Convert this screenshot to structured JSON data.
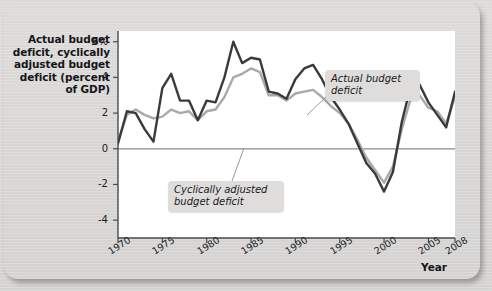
{
  "chart_data": {
    "type": "line",
    "title": "",
    "ylabel": "Actual budget deficit, cyclically adjusted budget deficit (percent of GDP)",
    "xlabel": "Year",
    "ylim": [
      -5,
      6.6
    ],
    "xlim": [
      1970,
      2008
    ],
    "yticks": [
      6,
      4,
      2,
      0,
      -2,
      -4
    ],
    "ytick_labels": [
      "6%",
      "4",
      "2",
      "0",
      "-2",
      "-4"
    ],
    "xticks": [
      1970,
      1975,
      1980,
      1985,
      1990,
      1995,
      2000,
      2005,
      2008
    ],
    "xtick_labels": [
      "1970",
      "1975",
      "1980",
      "1985",
      "1990",
      "1995",
      "2000",
      "2005",
      "2008"
    ],
    "grid": false,
    "legend_position": "annotations",
    "zero_line": 0,
    "x": [
      1970,
      1971,
      1972,
      1973,
      1974,
      1975,
      1976,
      1977,
      1978,
      1979,
      1980,
      1981,
      1982,
      1983,
      1984,
      1985,
      1986,
      1987,
      1988,
      1989,
      1990,
      1991,
      1992,
      1993,
      1994,
      1995,
      1996,
      1997,
      1998,
      1999,
      2000,
      2001,
      2002,
      2003,
      2004,
      2005,
      2006,
      2007,
      2008
    ],
    "series": [
      {
        "name": "Actual budget deficit",
        "color": "#3a3a3c",
        "values": [
          0.3,
          2.1,
          2.0,
          1.1,
          0.4,
          3.4,
          4.2,
          2.7,
          2.7,
          1.6,
          2.7,
          2.6,
          4.0,
          6.0,
          4.8,
          5.1,
          5.0,
          3.2,
          3.1,
          2.8,
          3.9,
          4.5,
          4.7,
          3.9,
          2.9,
          2.2,
          1.4,
          0.3,
          -0.8,
          -1.4,
          -2.4,
          -1.3,
          1.5,
          3.5,
          3.6,
          2.6,
          1.9,
          1.2,
          3.2
        ]
      },
      {
        "name": "Cyclically adjusted budget deficit",
        "color": "#a9a9a7",
        "values": [
          0.4,
          1.9,
          2.2,
          1.9,
          1.7,
          1.8,
          2.2,
          2.0,
          2.1,
          1.6,
          2.1,
          2.2,
          2.9,
          4.0,
          4.2,
          4.5,
          4.3,
          3.0,
          3.0,
          2.7,
          3.1,
          3.2,
          3.3,
          2.9,
          2.4,
          2.0,
          1.4,
          0.5,
          -0.5,
          -1.2,
          -1.9,
          -1.0,
          1.1,
          2.8,
          3.0,
          2.3,
          2.1,
          1.4,
          2.9
        ]
      }
    ],
    "annotations": [
      {
        "id": "actual",
        "text": "Actual budget\ndeficit"
      },
      {
        "id": "cyclical",
        "text": "Cyclically adjusted\nbudget deficit"
      }
    ]
  }
}
